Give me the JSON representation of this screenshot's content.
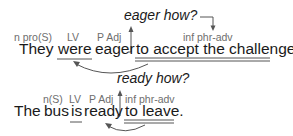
{
  "diagram": {
    "sentence1": {
      "question": "eager how?",
      "words": [
        "They",
        "were",
        "eager",
        "to accept the challenge."
      ],
      "tags": [
        "n pro(S)",
        "LV",
        "P Adj",
        "inf phr-adv"
      ]
    },
    "sentence2": {
      "question": "ready how?",
      "words": [
        "The",
        "bus",
        "is",
        "ready",
        "to leave."
      ],
      "tags": [
        "n(S)",
        "LV",
        "P Adj",
        "inf phr-adv"
      ]
    },
    "colors": {
      "text": "#1a1a1a",
      "tag": "#6e6e6e",
      "line": "#555555"
    }
  }
}
